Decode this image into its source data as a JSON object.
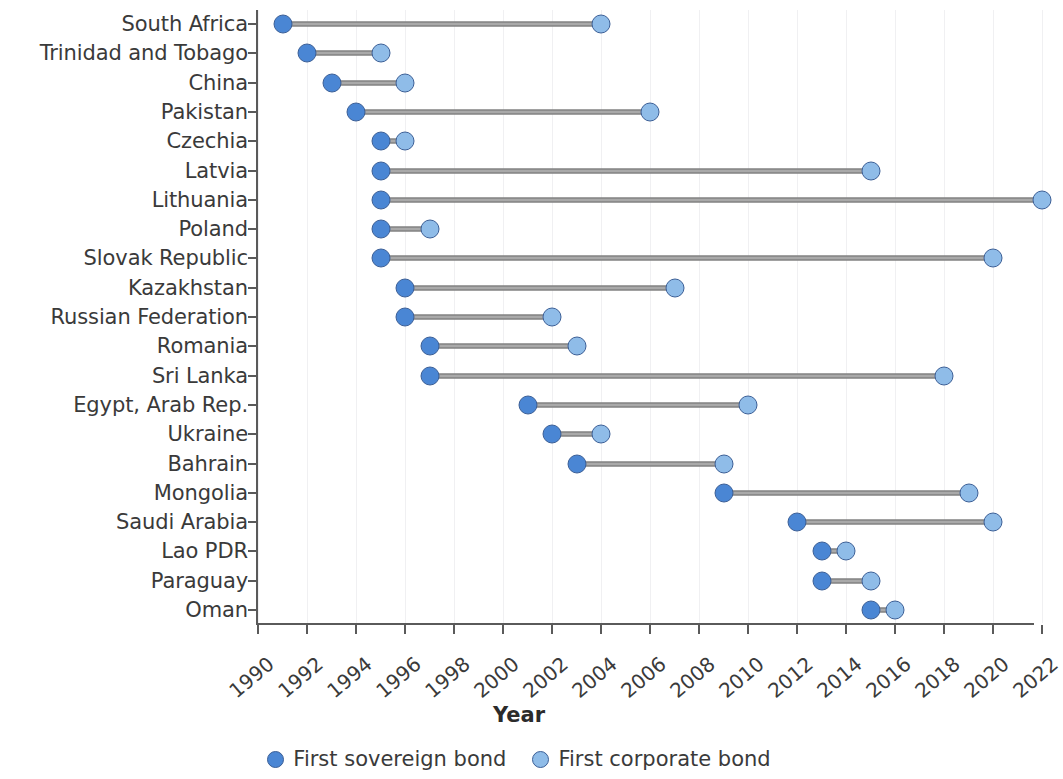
{
  "chart_data": {
    "type": "bar",
    "subtype": "dumbbell",
    "title": "",
    "xlabel": "Year",
    "ylabel": "",
    "xlim": [
      1990,
      2022.2
    ],
    "grid": "vertical-light",
    "legend_position": "bottom-center",
    "categories": [
      "South Africa",
      "Trinidad and Tobago",
      "China",
      "Pakistan",
      "Czechia",
      "Latvia",
      "Lithuania",
      "Poland",
      "Slovak Republic",
      "Kazakhstan",
      "Russian Federation",
      "Romania",
      "Sri Lanka",
      "Egypt, Arab Rep.",
      "Ukraine",
      "Bahrain",
      "Mongolia",
      "Saudi Arabia",
      "Lao PDR",
      "Paraguay",
      "Oman"
    ],
    "series": [
      {
        "name": "First sovereign bond",
        "color": "#4a86d4",
        "values": [
          1991,
          1992,
          1993,
          1994,
          1995,
          1995,
          1995,
          1995,
          1995,
          1996,
          1996,
          1997,
          1997,
          2001,
          2002,
          2003,
          2009,
          2012,
          2013,
          2013,
          2015
        ]
      },
      {
        "name": "First corporate bond",
        "color": "#8fbce8",
        "values": [
          2004,
          1995,
          1996,
          2006,
          1996,
          2015,
          2022,
          1997,
          2020,
          2007,
          2002,
          2003,
          2018,
          2010,
          2004,
          2009,
          2019,
          2020,
          2014,
          2015,
          2016
        ]
      }
    ],
    "xticks": [
      1990,
      1992,
      1994,
      1996,
      1998,
      2000,
      2002,
      2004,
      2006,
      2008,
      2010,
      2012,
      2014,
      2016,
      2018,
      2020,
      2022
    ],
    "xticklabels": [
      "1990",
      "1992",
      "1994",
      "1996",
      "1998",
      "2000",
      "2002",
      "2004",
      "2006",
      "2008",
      "2010",
      "2012",
      "2014",
      "2016",
      "2018",
      "2020",
      "2022"
    ]
  },
  "axis": {
    "x_title": "Year"
  },
  "legend": {
    "items": [
      {
        "label": "First sovereign bond",
        "marker": "sovereign-dot-icon"
      },
      {
        "label": "First corporate bond",
        "marker": "corporate-dot-icon"
      }
    ]
  }
}
